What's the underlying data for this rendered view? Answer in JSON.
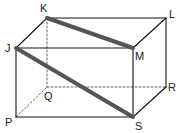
{
  "diagram": {
    "type": "rectangular-prism",
    "colors": {
      "edge": "#111111",
      "hidden_edge": "#555555",
      "highlight": "#555555",
      "label": "#222222",
      "background": "#ffffff"
    },
    "vertices": {
      "K": {
        "label": "K",
        "x": 47,
        "y": 18,
        "lx": 40,
        "ly": 12
      },
      "L": {
        "label": "L",
        "x": 166,
        "y": 18,
        "lx": 169,
        "ly": 18
      },
      "J": {
        "label": "J",
        "x": 16,
        "y": 48,
        "lx": 5,
        "ly": 52
      },
      "M": {
        "label": "M",
        "x": 133,
        "y": 48,
        "lx": 135,
        "ly": 60
      },
      "Q": {
        "label": "Q",
        "x": 47,
        "y": 87,
        "lx": 44,
        "ly": 100
      },
      "R": {
        "label": "R",
        "x": 166,
        "y": 87,
        "lx": 168,
        "ly": 91
      },
      "P": {
        "label": "P",
        "x": 16,
        "y": 117,
        "lx": 5,
        "ly": 126
      },
      "S": {
        "label": "S",
        "x": 133,
        "y": 117,
        "lx": 135,
        "ly": 130
      }
    },
    "solid_edges": [
      [
        "K",
        "L"
      ],
      [
        "J",
        "M"
      ],
      [
        "K",
        "J"
      ],
      [
        "L",
        "M"
      ],
      [
        "J",
        "P"
      ],
      [
        "M",
        "S"
      ],
      [
        "L",
        "R"
      ],
      [
        "P",
        "S"
      ],
      [
        "S",
        "R"
      ]
    ],
    "hidden_edges": [
      [
        "K",
        "Q"
      ],
      [
        "Q",
        "R"
      ],
      [
        "P",
        "Q"
      ]
    ],
    "highlighted_segments": [
      [
        "K",
        "M"
      ],
      [
        "J",
        "S"
      ]
    ]
  }
}
